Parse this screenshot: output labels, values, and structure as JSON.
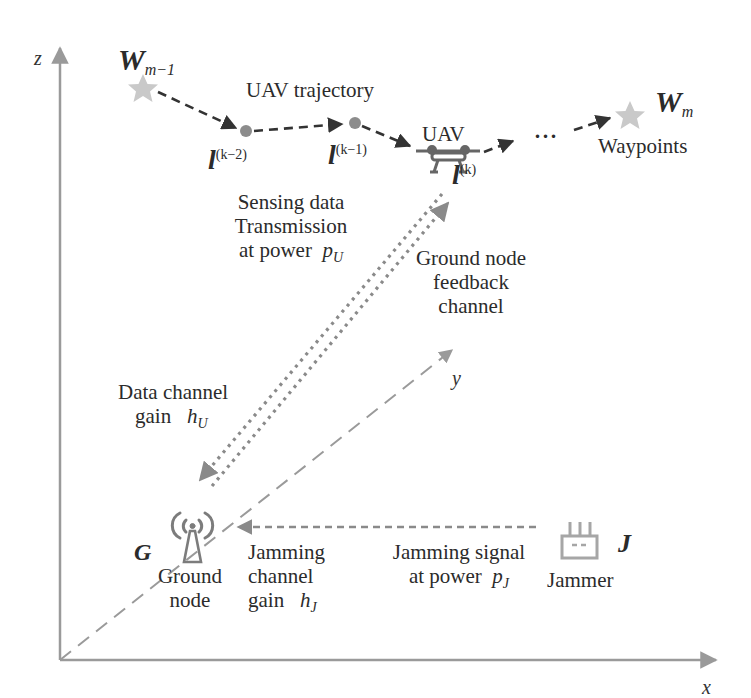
{
  "diagram": {
    "type": "system-model",
    "colors": {
      "axis": "#9a9a9a",
      "trajectory": "#333333",
      "waypoint_star": "#c9c9c9",
      "trajectory_point": "#8c8c8c",
      "channel_arrow": "#8a8a8a",
      "icon": "#8a8a8a",
      "text": "#2b2b2b"
    },
    "axes": {
      "z": "z",
      "y": "y",
      "x": "x"
    },
    "waypoints": {
      "start": {
        "symbol": "W",
        "subscript": "m−1"
      },
      "end": {
        "symbol": "W",
        "subscript": "m"
      },
      "label": "Waypoints"
    },
    "trajectory": {
      "label": "UAV trajectory",
      "ellipsis": "···",
      "points": [
        {
          "symbol": "l",
          "superscript": "(k−2)"
        },
        {
          "symbol": "l",
          "superscript": "(k−1)"
        },
        {
          "symbol": "l",
          "superscript": "(k)"
        }
      ]
    },
    "uav": {
      "label": "UAV"
    },
    "sensing": {
      "line1": "Sensing data",
      "line2": "Transmission",
      "line3": "at power",
      "power_symbol": "p",
      "power_sub": "U"
    },
    "feedback": {
      "line1": "Ground node",
      "line2": "feedback",
      "line3": "channel"
    },
    "data_channel": {
      "line1": "Data channel",
      "line2": "gain",
      "gain_symbol": "h",
      "gain_sub": "U"
    },
    "ground_node": {
      "symbol": "G",
      "line1": "Ground",
      "line2": "node"
    },
    "jamming_channel": {
      "line1": "Jamming",
      "line2": "channel",
      "line3": "gain",
      "gain_symbol": "h",
      "gain_sub": "J"
    },
    "jamming_signal": {
      "line1": "Jamming signal",
      "line2": "at power",
      "power_symbol": "p",
      "power_sub": "J"
    },
    "jammer": {
      "symbol": "J",
      "label": "Jammer"
    }
  }
}
